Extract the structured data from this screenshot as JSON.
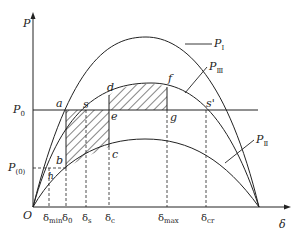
{
  "diagram": {
    "type": "power-angle characteristic (equal area criterion)",
    "axes": {
      "y_label": "P",
      "x_label": "δ",
      "origin_label": "O"
    },
    "curves": [
      {
        "name": "P_I",
        "label_main": "P",
        "label_sub": "Ⅰ",
        "description": "pre-fault characteristic"
      },
      {
        "name": "P_II",
        "label_main": "P",
        "label_sub": "Ⅱ",
        "description": "fault characteristic"
      },
      {
        "name": "P_III",
        "label_main": "P",
        "label_sub": "Ⅲ",
        "description": "post-fault characteristic"
      }
    ],
    "levels": {
      "P0": {
        "main": "P",
        "sub": "0"
      },
      "P_0_init": {
        "main": "P",
        "sub": "(0)"
      }
    },
    "points": {
      "a": "a",
      "b": "b",
      "c": "c",
      "d": "d",
      "e": "e",
      "f": "f",
      "g": "g",
      "s": "s",
      "s_prime": "s'",
      "h": "h"
    },
    "x_ticks": [
      {
        "main": "δ",
        "sub": "min"
      },
      {
        "main": "δ",
        "sub": "0"
      },
      {
        "main": "δ",
        "sub": "s"
      },
      {
        "main": "δ",
        "sub": "c"
      },
      {
        "main": "δ",
        "sub": "max"
      },
      {
        "main": "δ",
        "sub": "cr"
      }
    ],
    "regions": [
      {
        "name": "acceleration-area",
        "bounds": "a-b-c-e"
      },
      {
        "name": "deceleration-area",
        "bounds": "e-d-f-g"
      }
    ]
  }
}
